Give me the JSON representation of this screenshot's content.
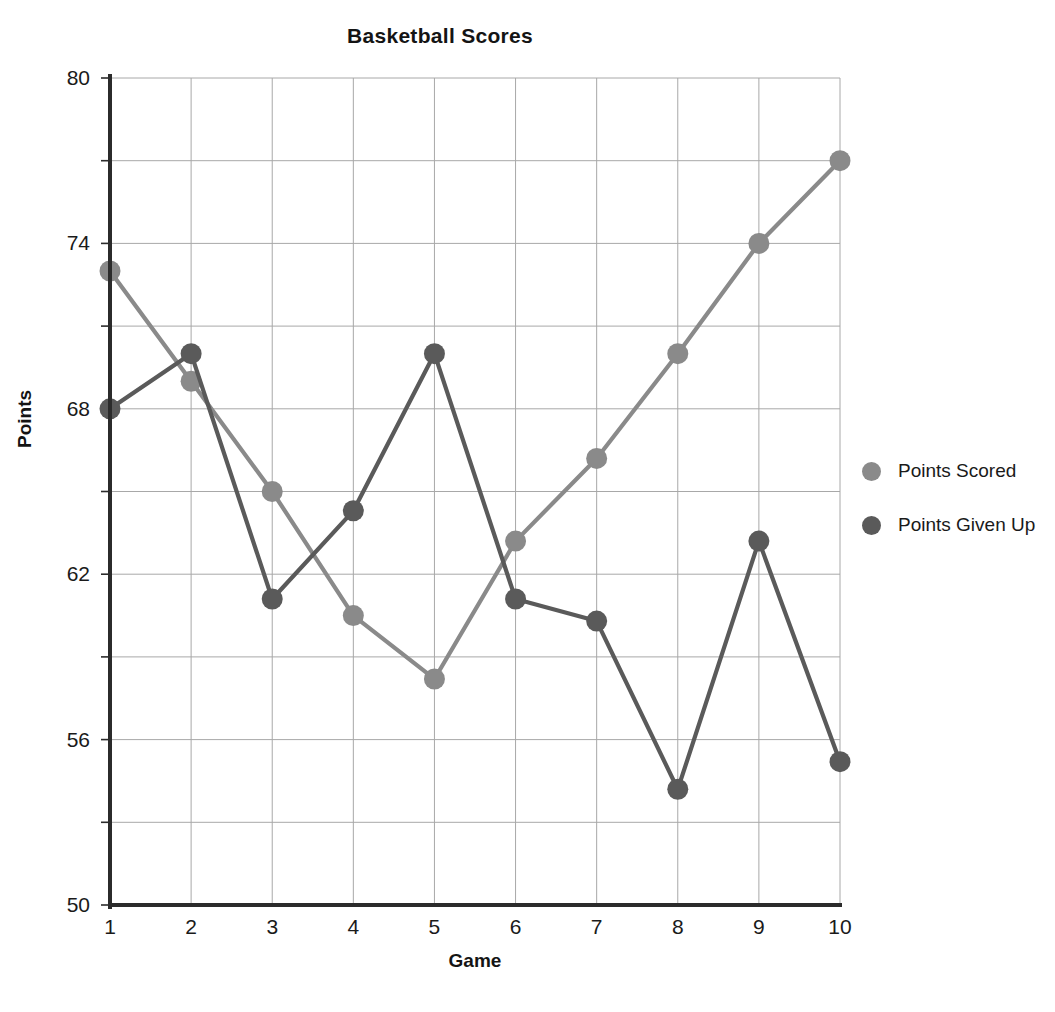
{
  "chart_data": {
    "type": "line",
    "title": "Basketball Scores",
    "xlabel": "Game",
    "ylabel": "Points",
    "categories": [
      "1",
      "2",
      "3",
      "4",
      "5",
      "6",
      "7",
      "8",
      "9",
      "10"
    ],
    "x": [
      1,
      2,
      3,
      4,
      5,
      6,
      7,
      8,
      9,
      10
    ],
    "xlim": [
      1,
      10
    ],
    "ylim": [
      50,
      80
    ],
    "y_tick_labels": [
      "50",
      "56",
      "62",
      "68",
      "74",
      "80"
    ],
    "y_tick_values": [
      50,
      56,
      62,
      68,
      74,
      80
    ],
    "y_gridline_values": [
      50,
      53,
      56,
      59,
      62,
      65,
      68,
      71,
      74,
      77,
      80
    ],
    "grid": "both",
    "legend_position": "right",
    "markers": "circle",
    "series": [
      {
        "name": "Points Scored",
        "color": "#8a8a8a",
        "values": [
          73,
          69,
          65,
          60.5,
          58.2,
          63.2,
          66.2,
          70,
          74,
          77
        ]
      },
      {
        "name": "Points Given Up",
        "color": "#5a5a5a",
        "values": [
          68,
          70,
          61.1,
          64.3,
          70,
          61.1,
          60.3,
          54.2,
          63.2,
          55.2
        ]
      }
    ]
  },
  "legend": {
    "entries": [
      {
        "label": "Points Scored"
      },
      {
        "label": "Points Given Up"
      }
    ]
  },
  "colors": {
    "series_scored": "#8a8a8a",
    "series_given_up": "#5a5a5a",
    "axis": "#2b2b2b",
    "grid": "#a8a8a8",
    "background": "#ffffff"
  }
}
